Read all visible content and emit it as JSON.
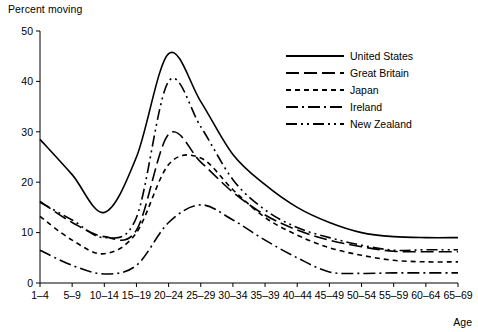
{
  "chart_data": {
    "type": "line",
    "title": "",
    "ylabel": "Percent moving",
    "xlabel": "Age",
    "ylim": [
      0,
      50
    ],
    "yticks": [
      0,
      10,
      20,
      30,
      40,
      50
    ],
    "grid": false,
    "legend_position": "upper-right",
    "categories": [
      "1–4",
      "5–9",
      "10–14",
      "15–19",
      "20–24",
      "25–29",
      "30–34",
      "35–39",
      "40–44",
      "45–49",
      "50–54",
      "55–59",
      "60–64",
      "65–69"
    ],
    "series": [
      {
        "name": "United States",
        "line_style": "solid",
        "values": [
          28.5,
          21.5,
          14.0,
          25.0,
          45.5,
          36.0,
          25.5,
          19.5,
          15.0,
          12.0,
          10.0,
          9.2,
          9.0,
          9.0
        ]
      },
      {
        "name": "Great Britain",
        "line_style": "long-dash",
        "values": [
          16.2,
          12.0,
          9.2,
          10.5,
          29.5,
          24.0,
          18.0,
          13.5,
          10.5,
          8.5,
          7.2,
          6.3,
          6.2,
          6.2
        ]
      },
      {
        "name": "Japan",
        "line_style": "short-dash",
        "values": [
          13.2,
          8.5,
          5.8,
          10.0,
          23.5,
          24.8,
          18.5,
          13.0,
          9.5,
          7.0,
          5.5,
          4.5,
          4.2,
          4.2
        ]
      },
      {
        "name": "Ireland",
        "line_style": "dash-dot",
        "values": [
          6.5,
          3.5,
          1.8,
          3.5,
          12.0,
          15.5,
          12.5,
          8.5,
          5.0,
          2.2,
          1.9,
          2.0,
          2.0,
          2.0
        ]
      },
      {
        "name": "New Zealand",
        "line_style": "dash-dot-dot",
        "values": [
          16.0,
          12.5,
          9.0,
          13.0,
          40.0,
          31.0,
          20.5,
          14.5,
          11.0,
          9.0,
          7.5,
          6.5,
          6.6,
          6.6
        ]
      }
    ]
  },
  "axis": {
    "y_title": "Percent moving",
    "x_title": "Age",
    "y_tick_labels": [
      "0",
      "10",
      "20",
      "30",
      "40",
      "50"
    ],
    "x_tick_labels": [
      "1–4",
      "5–9",
      "10–14",
      "15–19",
      "20–24",
      "25–29",
      "30–34",
      "35–39",
      "40–44",
      "45–49",
      "50–54",
      "55–59",
      "60–64",
      "65–69"
    ]
  },
  "legend": {
    "entries": [
      {
        "label": "United States",
        "style": "solid"
      },
      {
        "label": "Great Britain",
        "style": "long-dash"
      },
      {
        "label": "Japan",
        "style": "short-dash"
      },
      {
        "label": "Ireland",
        "style": "dash-dot"
      },
      {
        "label": "New Zealand",
        "style": "dash-dot-dot"
      }
    ]
  },
  "colors": {
    "ink": "#000000",
    "background": "#ffffff"
  }
}
